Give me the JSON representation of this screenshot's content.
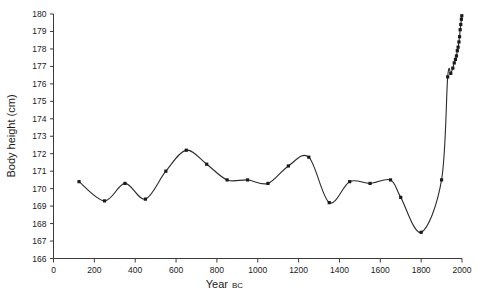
{
  "chart_data": {
    "type": "line",
    "title": "",
    "xlabel": "Year",
    "xlabel_suffix": "BC",
    "ylabel": "Body height (cm)",
    "xlim": [
      0,
      2000
    ],
    "ylim": [
      166,
      180
    ],
    "xticks": [
      0,
      200,
      400,
      600,
      800,
      1000,
      1200,
      1400,
      1600,
      1800,
      2000
    ],
    "yticks": [
      166,
      167,
      168,
      169,
      170,
      171,
      172,
      173,
      174,
      175,
      176,
      177,
      178,
      179,
      180
    ],
    "grid": false,
    "legend": false,
    "marker": "square",
    "line_color": "#2b2b2b",
    "marker_color": "#1a1a1a",
    "x": [
      125,
      250,
      350,
      450,
      550,
      650,
      750,
      850,
      950,
      1050,
      1150,
      1250,
      1350,
      1450,
      1550,
      1650,
      1700,
      1800,
      1900,
      1930,
      1945,
      1955,
      1962,
      1968,
      1973,
      1977,
      1981,
      1985,
      1988,
      1991,
      1994,
      1997,
      1999
    ],
    "values": [
      170.4,
      169.3,
      170.3,
      169.4,
      171.0,
      172.2,
      171.4,
      170.5,
      170.5,
      170.3,
      171.3,
      171.8,
      169.2,
      170.4,
      170.3,
      170.5,
      169.5,
      167.5,
      170.5,
      176.4,
      176.6,
      176.9,
      177.2,
      177.4,
      177.6,
      177.9,
      178.1,
      178.4,
      178.7,
      179.1,
      179.4,
      179.7,
      179.9
    ]
  }
}
